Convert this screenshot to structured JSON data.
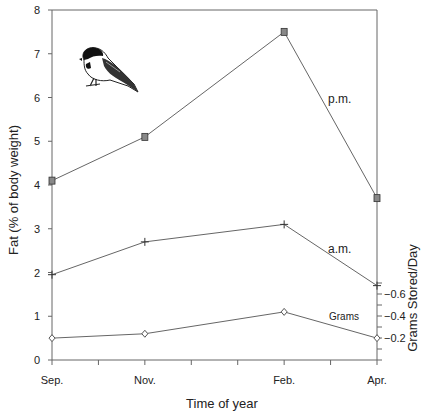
{
  "chart_data": {
    "type": "line",
    "title": "",
    "xlabel": "Time of year",
    "ylabel": "Fat (% of body weight)",
    "ylabel_right": "Grams Stored/Day",
    "categories": [
      "Sep.",
      "Nov.",
      "Feb.",
      "Apr."
    ],
    "x_positions_months": [
      0,
      2,
      5,
      7
    ],
    "ylim": [
      0,
      8
    ],
    "yticks": [
      0,
      1,
      2,
      3,
      4,
      5,
      6,
      7,
      8
    ],
    "ylim_right_ticks": [
      "0.2",
      "0.4",
      "0.6"
    ],
    "grid": false,
    "series": [
      {
        "name": "p.m.",
        "marker": "square",
        "values": [
          4.1,
          5.1,
          7.5,
          3.7
        ]
      },
      {
        "name": "a.m.",
        "marker": "plus",
        "values": [
          1.95,
          2.7,
          3.1,
          1.7
        ]
      },
      {
        "name": "Grams",
        "marker": "diamond",
        "axis": "right",
        "values": [
          0.5,
          0.6,
          1.1,
          0.5
        ]
      }
    ],
    "annotations": [
      "p.m.",
      "a.m.",
      "Grams"
    ],
    "image": "chickadee-illustration"
  }
}
